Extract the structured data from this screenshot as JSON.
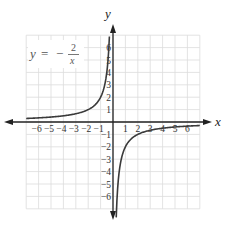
{
  "chart_data": {
    "type": "line",
    "title": "",
    "function": "y = -2/x",
    "annotation": {
      "lhs": "y",
      "equals": "=",
      "sign": "−",
      "numerator": "2",
      "denominator": "x"
    },
    "xlabel": "x",
    "ylabel": "y",
    "xlim": [
      -7,
      7
    ],
    "ylim": [
      -7,
      7
    ],
    "grid": true,
    "x_ticks": [
      "−6",
      "−5",
      "−4",
      "−3",
      "−2",
      "−1",
      "1",
      "2",
      "3",
      "4",
      "5",
      "6"
    ],
    "y_ticks": [
      "6",
      "5",
      "4",
      "3",
      "2",
      "1",
      "−1",
      "−2",
      "−3",
      "−4",
      "−5",
      "−6"
    ],
    "series": [
      {
        "name": "left branch",
        "x": [
          -7,
          -6,
          -5,
          -4,
          -3,
          -2,
          -1,
          -0.5,
          -0.4,
          -0.3
        ],
        "y": [
          0.286,
          0.333,
          0.4,
          0.5,
          0.667,
          1,
          2,
          4,
          5,
          6.67
        ]
      },
      {
        "name": "right branch",
        "x": [
          0.3,
          0.4,
          0.5,
          1,
          2,
          3,
          4,
          5,
          6,
          7
        ],
        "y": [
          -6.67,
          -5,
          -4,
          -2,
          -1,
          -0.667,
          -0.5,
          -0.4,
          -0.333,
          -0.286
        ]
      }
    ]
  },
  "colors": {
    "grid": "#dcdcdc",
    "axis": "#222222",
    "curve": "#3a3a3a",
    "text": "#333333"
  }
}
